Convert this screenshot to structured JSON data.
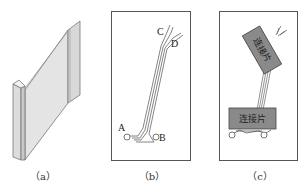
{
  "figure": {
    "panels": [
      {
        "id": "a",
        "caption": "（a）",
        "description": "3D view of flexible flat cable strip"
      },
      {
        "id": "b",
        "caption": "（b）",
        "description": "Trace routing diagram",
        "points": {
          "A": "A",
          "B": "B",
          "C": "C",
          "D": "D"
        }
      },
      {
        "id": "c",
        "caption": "（c）",
        "description": "Connector placement",
        "connectors": [
          {
            "label": "连接片"
          },
          {
            "label": "连接片"
          }
        ]
      }
    ]
  }
}
